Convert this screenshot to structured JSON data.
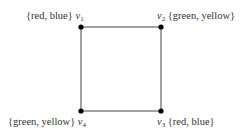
{
  "graph": {
    "title": "",
    "vertices": [
      {
        "id": "v1",
        "name": "v",
        "sub": "1",
        "colors": "{red, blue}",
        "label_side": "left"
      },
      {
        "id": "v2",
        "name": "v",
        "sub": "2",
        "colors": "{green, yellow}",
        "label_side": "right"
      },
      {
        "id": "v3",
        "name": "v",
        "sub": "3",
        "colors": "{red, blue}",
        "label_side": "right"
      },
      {
        "id": "v4",
        "name": "v",
        "sub": "4",
        "colors": "{green, yellow}",
        "label_side": "left"
      }
    ],
    "edges": [
      [
        "v1",
        "v2"
      ],
      [
        "v2",
        "v3"
      ],
      [
        "v3",
        "v4"
      ],
      [
        "v4",
        "v1"
      ]
    ],
    "edge_color": "#444444",
    "node_color": "#000000"
  }
}
